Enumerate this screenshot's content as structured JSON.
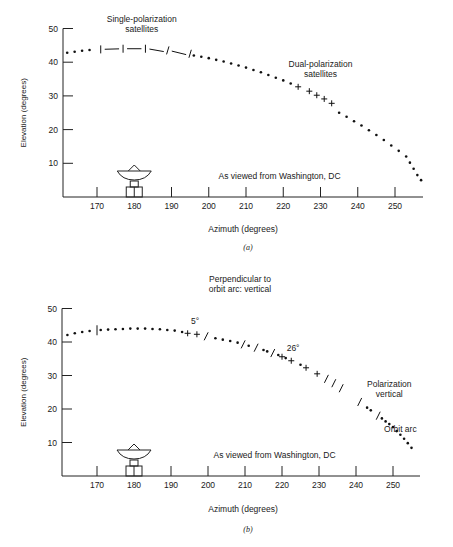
{
  "chart_data": [
    {
      "id": "a",
      "type": "scatter",
      "caption": "(a)",
      "xlabel": "Azimuth (degrees)",
      "ylabel": "Elevation (degrees)",
      "xticks": [
        170,
        180,
        190,
        200,
        210,
        220,
        230,
        240,
        250
      ],
      "yticks": [
        10,
        20,
        30,
        40,
        50
      ],
      "xlim": [
        162,
        257
      ],
      "ylim": [
        0,
        50
      ],
      "grid": false,
      "annotations": [
        {
          "text": [
            "Single-polarization",
            "satellites"
          ],
          "az": 182,
          "el": 52
        },
        {
          "text": [
            "Dual-polarization",
            "satellites"
          ],
          "az": 230,
          "el": 38.5
        },
        {
          "text": [
            "As viewed from Washington, DC"
          ],
          "az": 219,
          "el": 5.3
        }
      ],
      "series": [
        {
          "name": "Orbit arc (dots)",
          "marker": "dot",
          "points": [
            [
              162,
              42.8
            ],
            [
              164,
              43.1
            ],
            [
              166,
              43.4
            ],
            [
              168,
              43.6
            ],
            [
              196,
              42.0
            ],
            [
              198,
              41.6
            ],
            [
              200,
              41.2
            ],
            [
              202,
              40.7
            ],
            [
              204,
              40.2
            ],
            [
              206,
              39.6
            ],
            [
              208,
              39.0
            ],
            [
              210,
              38.4
            ],
            [
              212,
              37.7
            ],
            [
              214,
              37.0
            ],
            [
              216,
              36.2
            ],
            [
              218,
              35.4
            ],
            [
              220,
              34.6
            ],
            [
              222,
              33.7
            ],
            [
              235,
              25.0
            ],
            [
              237,
              23.8
            ],
            [
              239,
              22.5
            ],
            [
              241,
              21.2
            ],
            [
              243,
              19.8
            ],
            [
              245,
              18.4
            ],
            [
              247,
              16.9
            ],
            [
              249,
              15.3
            ],
            [
              251,
              13.7
            ],
            [
              253,
              12.0
            ],
            [
              254,
              10.2
            ],
            [
              255,
              8.4
            ],
            [
              256,
              6.5
            ],
            [
              257,
              5.0
            ]
          ]
        },
        {
          "name": "Single-polarization satellites",
          "marker": "tick-dash",
          "points": [
            [
              171,
              43.8
            ],
            [
              177,
              44.0
            ],
            [
              183,
              44.0
            ],
            [
              189,
              43.5
            ],
            [
              195,
              42.5
            ]
          ]
        },
        {
          "name": "Dual-polarization satellites",
          "marker": "cross",
          "points": [
            [
              224,
              32.7
            ],
            [
              227,
              31.4
            ],
            [
              229,
              30.2
            ],
            [
              231,
              29.1
            ],
            [
              233,
              27.8
            ]
          ]
        }
      ]
    },
    {
      "id": "b",
      "type": "scatter",
      "caption": "(b)",
      "title": [
        "Perpendicular to",
        "orbit arc: vertical"
      ],
      "xlabel": "Azimuth (degrees)",
      "ylabel": "Elevation (degrees)",
      "xticks": [
        170,
        180,
        190,
        200,
        210,
        220,
        230,
        240,
        250
      ],
      "yticks": [
        10,
        20,
        30,
        40,
        50
      ],
      "xlim": [
        162,
        255
      ],
      "ylim": [
        0,
        50
      ],
      "grid": false,
      "annotations": [
        {
          "text": [
            "5°"
          ],
          "az": 196.5,
          "el": 45.5
        },
        {
          "text": [
            "26°"
          ],
          "az": 223,
          "el": 37.2
        },
        {
          "text": [
            "Polarization",
            "vertical"
          ],
          "az": 249,
          "el": 26.5
        },
        {
          "text": [
            "Orbit arc"
          ],
          "az": 252,
          "el": 13.2
        },
        {
          "text": [
            "As viewed from Washington, DC"
          ],
          "az": 218,
          "el": 5.3
        }
      ],
      "series": [
        {
          "name": "Orbit arc (dots)",
          "marker": "dot",
          "points": [
            [
              162,
              42.1
            ],
            [
              164,
              42.6
            ],
            [
              166,
              43.0
            ],
            [
              168,
              43.3
            ],
            [
              171,
              43.6
            ],
            [
              173,
              43.7
            ],
            [
              175,
              43.8
            ],
            [
              177,
              43.9
            ],
            [
              179,
              44.0
            ],
            [
              181,
              44.0
            ],
            [
              183,
              44.0
            ],
            [
              185,
              43.9
            ],
            [
              187,
              43.8
            ],
            [
              189,
              43.6
            ],
            [
              191,
              43.4
            ],
            [
              193,
              43.0
            ],
            [
              202,
              41.1
            ],
            [
              204,
              40.7
            ],
            [
              206,
              40.3
            ],
            [
              208,
              39.8
            ],
            [
              211,
              38.9
            ],
            [
              215,
              37.6
            ],
            [
              216,
              37.2
            ],
            [
              219,
              36.1
            ],
            [
              221,
              35.2
            ],
            [
              225,
              33.2
            ],
            [
              243,
              20.4
            ],
            [
              244,
              19.6
            ],
            [
              247,
              17.2
            ],
            [
              248,
              16.3
            ],
            [
              249,
              15.5
            ],
            [
              250,
              14.6
            ],
            [
              251,
              13.4
            ],
            [
              252,
              12.3
            ],
            [
              253,
              11.1
            ],
            [
              254,
              9.8
            ],
            [
              255,
              8.4
            ]
          ]
        },
        {
          "name": "Vertical ticks",
          "marker": "vtick",
          "points": [
            [
              170,
              43.5
            ]
          ]
        },
        {
          "name": "Crosses",
          "marker": "cross",
          "points": [
            [
              194.5,
              42.6
            ],
            [
              197,
              42.3
            ],
            [
              220,
              35.6
            ],
            [
              222.5,
              34.4
            ],
            [
              226.5,
              32.3
            ],
            [
              229.5,
              30.5
            ]
          ]
        },
        {
          "name": "Slashes",
          "marker": "slash",
          "points": [
            [
              199.5,
              41.7
            ],
            [
              209.5,
              39.3
            ],
            [
              213,
              38.3
            ],
            [
              217.5,
              36.7
            ],
            [
              232,
              29.0
            ],
            [
              234,
              27.7
            ],
            [
              236,
              26.2
            ],
            [
              241,
              22.1
            ],
            [
              246,
              18.0
            ]
          ]
        }
      ]
    }
  ]
}
